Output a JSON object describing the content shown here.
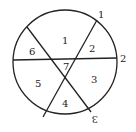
{
  "diagram": {
    "regions": [
      "1",
      "2",
      "3",
      "4",
      "5",
      "6",
      "7"
    ],
    "line_labels": [
      "1",
      "2",
      "3"
    ],
    "colors": {
      "stroke": "#222222",
      "background": "#ffffff"
    }
  }
}
